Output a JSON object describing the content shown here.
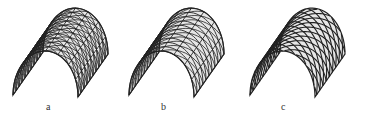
{
  "figure": {
    "panels": [
      {
        "id": "a",
        "label": "a",
        "pattern": "triangulated-dense-with-diagonals"
      },
      {
        "id": "b",
        "label": "b",
        "pattern": "triangulated-three-way-grid"
      },
      {
        "id": "c",
        "label": "c",
        "pattern": "curved-diamond-lamella-grid"
      }
    ],
    "line_color": "#222222",
    "fill_color": "#e6e6e6"
  }
}
